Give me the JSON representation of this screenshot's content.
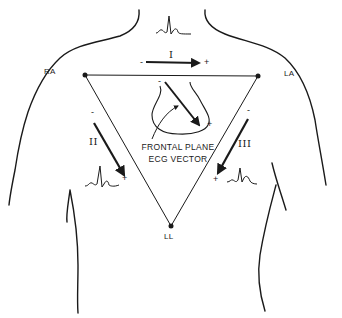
{
  "diagram": {
    "colors": {
      "ink": "#1a1a1a",
      "background": "#ffffff"
    },
    "electrodes": [
      {
        "id": "RA",
        "label": "RA"
      },
      {
        "id": "LA",
        "label": "LA"
      },
      {
        "id": "LL",
        "label": "LL"
      }
    ],
    "leads": [
      {
        "id": "I",
        "label": "I",
        "negative": "-",
        "positive": "+",
        "from": "RA",
        "to": "LA"
      },
      {
        "id": "II",
        "label": "II",
        "negative": "-",
        "positive": "+",
        "from": "RA",
        "to": "LL"
      },
      {
        "id": "III",
        "label": "III",
        "negative": "-",
        "positive": "+",
        "from": "LA",
        "to": "LL"
      }
    ],
    "heart_vector": {
      "negative": "-",
      "positive": "+",
      "caption_line1": "FRONTAL PLANE",
      "caption_line2": "ECG VECTOR"
    },
    "waveforms": [
      "lead-I-qrs",
      "lead-II-qrs",
      "lead-III-qrs"
    ]
  }
}
